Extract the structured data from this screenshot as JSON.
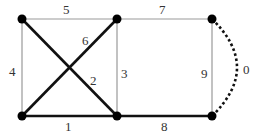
{
  "diagram": {
    "type": "graph",
    "nodes": [
      {
        "id": "A",
        "x": 22,
        "y": 19
      },
      {
        "id": "B",
        "x": 117,
        "y": 19
      },
      {
        "id": "C",
        "x": 212,
        "y": 19
      },
      {
        "id": "D",
        "x": 22,
        "y": 116
      },
      {
        "id": "E",
        "x": 117,
        "y": 116
      },
      {
        "id": "F",
        "x": 212,
        "y": 116
      }
    ],
    "edges": [
      {
        "label": "0",
        "from": "C",
        "to": "F",
        "style": "dotted-arc"
      },
      {
        "label": "1",
        "from": "D",
        "to": "E",
        "style": "bold"
      },
      {
        "label": "2",
        "from": "A",
        "to": "E",
        "style": "bold"
      },
      {
        "label": "3",
        "from": "B",
        "to": "E",
        "style": "thin"
      },
      {
        "label": "4",
        "from": "A",
        "to": "D",
        "style": "thin"
      },
      {
        "label": "5",
        "from": "A",
        "to": "B",
        "style": "thin"
      },
      {
        "label": "6",
        "from": "D",
        "to": "B",
        "style": "bold"
      },
      {
        "label": "7",
        "from": "B",
        "to": "C",
        "style": "thin"
      },
      {
        "label": "8",
        "from": "E",
        "to": "F",
        "style": "bold"
      },
      {
        "label": "9",
        "from": "C",
        "to": "F",
        "style": "thin"
      }
    ],
    "labels": {
      "e0": "0",
      "e1": "1",
      "e2": "2",
      "e3": "3",
      "e4": "4",
      "e5": "5",
      "e6": "6",
      "e7": "7",
      "e8": "8",
      "e9": "9"
    }
  }
}
